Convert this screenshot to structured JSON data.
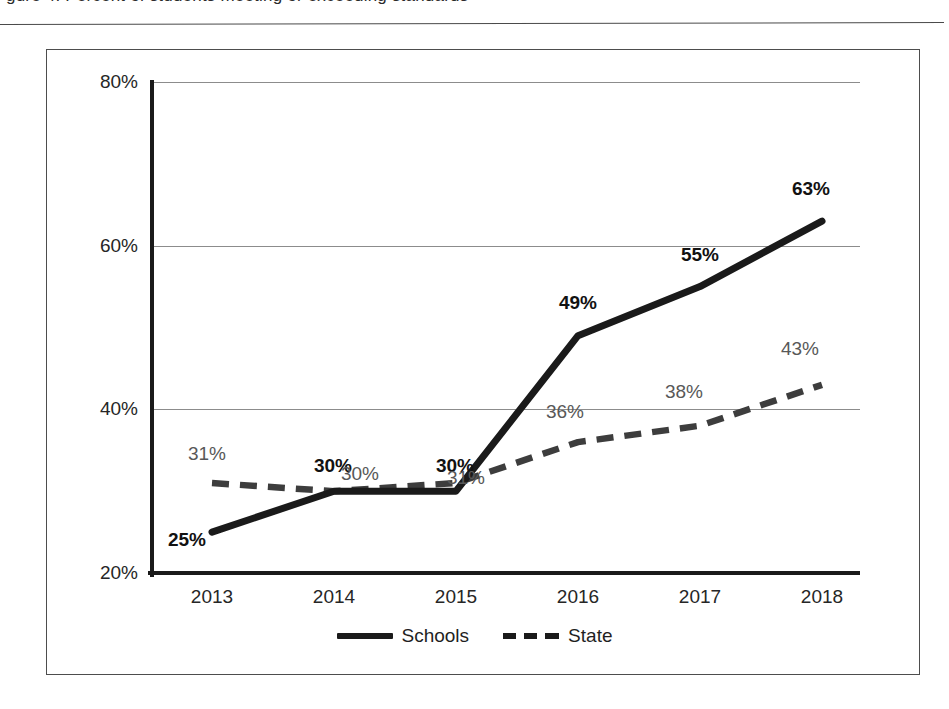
{
  "page": {
    "top_title_fragment": "gure 4.  Percent of students meeting or exceeding standards",
    "background_color": "#ffffff"
  },
  "chart_data": {
    "type": "line",
    "title": "",
    "xlabel": "",
    "ylabel": "",
    "categories": [
      "2013",
      "2014",
      "2015",
      "2016",
      "2017",
      "2018"
    ],
    "ylim": [
      20,
      80
    ],
    "y_ticks": [
      "20%",
      "40%",
      "60%",
      "80%"
    ],
    "y_tick_values": [
      20,
      40,
      60,
      80
    ],
    "grid": "horizontal",
    "legend_position": "bottom-center",
    "series": [
      {
        "name": "Schools",
        "style": "solid",
        "color": "#1a1a1a",
        "values": [
          25,
          30,
          30,
          49,
          55,
          63
        ],
        "labels": [
          "25%",
          "30%",
          "30%",
          "49%",
          "55%",
          "63%"
        ],
        "label_color": "#121212",
        "label_weight": "bold"
      },
      {
        "name": "State",
        "style": "dashed",
        "color": "#3d3d3d",
        "values": [
          31,
          30,
          31,
          36,
          38,
          43
        ],
        "labels": [
          "31%",
          "30%",
          "31%",
          "36%",
          "38%",
          "43%"
        ],
        "label_color": "#585858",
        "label_weight": "normal"
      }
    ]
  },
  "legend": {
    "items": [
      {
        "label": "Schools",
        "swatch": "solid-line-swatch"
      },
      {
        "label": "State",
        "swatch": "dashed-line-swatch"
      }
    ]
  }
}
